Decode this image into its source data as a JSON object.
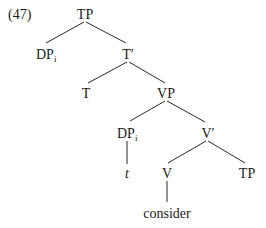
{
  "example_number": "(47)",
  "tree": {
    "nodes": {
      "root_tp": {
        "label": "TP"
      },
      "dp_spec": {
        "label": "DP",
        "subscript": "i"
      },
      "t_bar": {
        "label": "T′"
      },
      "t_head": {
        "label": "T"
      },
      "vp": {
        "label": "VP"
      },
      "dp_trace_node": {
        "label": "DP",
        "subscript": "i"
      },
      "v_bar": {
        "label": "V′"
      },
      "trace": {
        "label": "t"
      },
      "v_head": {
        "label": "V"
      },
      "tp_complement": {
        "label": "TP"
      },
      "verb": {
        "label": "consider"
      }
    },
    "edges": [
      [
        "root_tp",
        "dp_spec"
      ],
      [
        "root_tp",
        "t_bar"
      ],
      [
        "t_bar",
        "t_head"
      ],
      [
        "t_bar",
        "vp"
      ],
      [
        "vp",
        "dp_trace_node"
      ],
      [
        "vp",
        "v_bar"
      ],
      [
        "dp_trace_node",
        "trace"
      ],
      [
        "v_bar",
        "v_head"
      ],
      [
        "v_bar",
        "tp_complement"
      ],
      [
        "v_head",
        "verb"
      ]
    ]
  }
}
